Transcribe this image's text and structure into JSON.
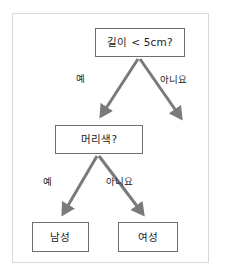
{
  "diagram": {
    "type": "decision-tree",
    "title": "",
    "language": "ko",
    "colors": {
      "background": "#ffffff",
      "frame_border": "#d9d9d9",
      "node_border": "#6e6e6e",
      "node_fill": "#ffffff",
      "arrow": "#7a7a7a",
      "text": "#1c1c1c"
    },
    "nodes": {
      "root": {
        "id": "root",
        "label": "길이 < 5cm?",
        "kind": "decision"
      },
      "internal": {
        "id": "hair-color",
        "label": "머리색?",
        "kind": "decision"
      },
      "leaf_left": {
        "id": "male",
        "label": "남성",
        "kind": "leaf"
      },
      "leaf_right": {
        "id": "female",
        "label": "여성",
        "kind": "leaf"
      }
    },
    "edges": {
      "root_yes": {
        "label": "예",
        "from": "root",
        "to": "hair-color"
      },
      "root_no": {
        "label": "아니요",
        "from": "root",
        "to": ""
      },
      "hair_yes": {
        "label": "예",
        "from": "hair-color",
        "to": "male"
      },
      "hair_no": {
        "label": "아니요",
        "from": "hair-color",
        "to": "female"
      }
    }
  }
}
